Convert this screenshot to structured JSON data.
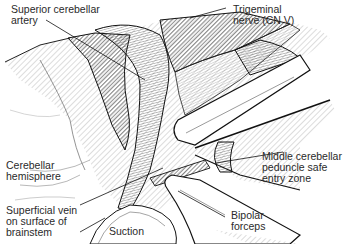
{
  "figure": {
    "type": "surgical anatomy illustration",
    "labels": {
      "superior_cerebellar_artery": "Superior cerebellar\nartery",
      "trigeminal_nerve": "Trigeminal\nnerve (CN V)",
      "cerebellar_hemisphere": "Cerebellar\nhemisphere",
      "middle_cerebellar_peduncle": "Middle cerebellar\npeduncle safe\nentry zone",
      "superficial_vein": "Superficial vein\non surface of\nbrainstem",
      "suction": "Suction",
      "bipolar_forceps": "Bipolar\nforceps"
    },
    "colors": {
      "ink": "#1a1a1a",
      "hatch": "#555555",
      "background": "#ffffff",
      "instrument_fill": "#ffffff"
    }
  }
}
